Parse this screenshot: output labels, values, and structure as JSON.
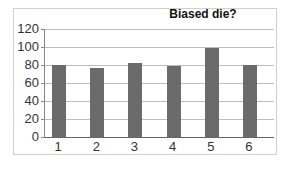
{
  "chart_data": {
    "type": "bar",
    "title": "Biased die?",
    "xlabel": "",
    "ylabel": "",
    "categories": [
      "1",
      "2",
      "3",
      "4",
      "5",
      "6"
    ],
    "values": [
      80,
      77,
      82,
      79,
      99,
      80
    ],
    "ylim": [
      0,
      120
    ],
    "yticks": [
      "0",
      "20",
      "40",
      "60",
      "80",
      "100",
      "120"
    ],
    "grid": true,
    "legend": "none",
    "bar_color": "#6b6b6b"
  }
}
